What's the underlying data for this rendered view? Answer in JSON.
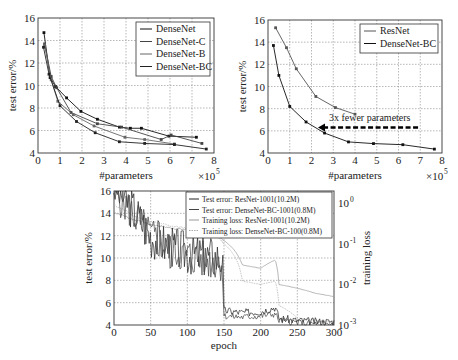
{
  "chart_data": [
    {
      "type": "line",
      "title": "",
      "xlabel": "#parameters",
      "x_multiplier": "×10^5",
      "ylabel": "test error/%",
      "xlim": [
        0,
        8
      ],
      "ylim": [
        4,
        16
      ],
      "xticks": [
        "0",
        "1",
        "2",
        "3",
        "4",
        "5",
        "6",
        "7",
        "8"
      ],
      "yticks": [
        "4",
        "6",
        "8",
        "10",
        "12",
        "14",
        "16"
      ],
      "grid": true,
      "legend_position": "upper right",
      "series": [
        {
          "name": "DenseNet",
          "x": [
            0.27,
            0.55,
            0.8,
            1.3,
            1.95,
            2.7,
            3.7,
            4.2,
            4.7,
            5.95,
            7.2
          ],
          "y": [
            14.7,
            10.7,
            9.9,
            8.9,
            7.7,
            7.0,
            6.3,
            6.2,
            6.2,
            5.5,
            5.4
          ]
        },
        {
          "name": "DenseNet-C",
          "x": [
            0.3,
            0.6,
            0.85,
            1.5,
            2.7,
            3.8,
            5.6,
            6.05,
            7.45
          ],
          "y": [
            13.7,
            10.8,
            9.8,
            7.6,
            6.6,
            6.3,
            5.2,
            5.6,
            4.85
          ]
        },
        {
          "name": "DenseNet-B",
          "x": [
            0.3,
            0.6,
            0.9,
            1.6,
            2.55,
            3.95,
            4.85,
            6.2
          ],
          "y": [
            13.6,
            10.5,
            8.6,
            7.4,
            6.4,
            5.4,
            5.2,
            4.8
          ]
        },
        {
          "name": "DenseNet-BC",
          "x": [
            0.25,
            0.5,
            1.0,
            1.75,
            2.6,
            3.7,
            4.85,
            6.2,
            7.65
          ],
          "y": [
            13.4,
            11.0,
            8.2,
            6.8,
            5.8,
            5.0,
            4.85,
            4.75,
            4.35
          ]
        }
      ]
    },
    {
      "type": "line",
      "title": "",
      "xlabel": "#parameters",
      "x_multiplier": "×10^5",
      "ylabel": "test error/%",
      "xlim": [
        0,
        8
      ],
      "ylim": [
        4,
        16
      ],
      "xticks": [
        "0",
        "1",
        "2",
        "3",
        "4",
        "5",
        "6",
        "7",
        "8"
      ],
      "yticks": [
        "4",
        "6",
        "8",
        "10",
        "12",
        "14",
        "16"
      ],
      "grid": true,
      "legend_position": "upper right",
      "annotations": [
        {
          "text": "3x fewer parameters",
          "arrow_from": [
            6.9,
            6.3
          ],
          "arrow_to": [
            2.3,
            6.3
          ]
        }
      ],
      "series": [
        {
          "name": "ResNet",
          "x": [
            0.35,
            0.85,
            1.3,
            2.2,
            3.1,
            4.0
          ],
          "y": [
            15.3,
            13.5,
            11.6,
            9.1,
            8.1,
            7.5
          ]
        },
        {
          "name": "DenseNet-BC",
          "x": [
            0.25,
            0.5,
            1.0,
            1.75,
            2.6,
            3.7,
            4.85,
            6.2,
            7.65
          ],
          "y": [
            13.7,
            11.0,
            8.2,
            6.8,
            5.8,
            5.0,
            4.85,
            4.75,
            4.35
          ]
        }
      ]
    },
    {
      "type": "line",
      "title": "",
      "xlabel": "epoch",
      "ylabel": "test error/%",
      "y2label": "training loss",
      "xlim": [
        0,
        300
      ],
      "ylim": [
        4,
        16
      ],
      "y2lim_log": [
        0.001,
        2
      ],
      "xticks": [
        "0",
        "50",
        "100",
        "150",
        "200",
        "250",
        "300"
      ],
      "yticks": [
        "4",
        "6",
        "8",
        "10",
        "12",
        "14",
        "16"
      ],
      "y2ticks": [
        "10^-3",
        "10^-2",
        "10^-1",
        "10^0"
      ],
      "grid": true,
      "legend_position": "upper right",
      "series": [
        {
          "name": "Test error: ResNet-1001(10.2M)",
          "axis": "left",
          "x": [
            0,
            25,
            50,
            75,
            100,
            125,
            148,
            150,
            175,
            200,
            220,
            225,
            250,
            275,
            300
          ],
          "y": [
            16.5,
            14.5,
            12.0,
            11.0,
            10.5,
            10.2,
            10.0,
            5.3,
            5.1,
            5.2,
            5.6,
            4.6,
            4.4,
            4.3,
            4.3
          ]
        },
        {
          "name": "Test error: DenseNet-BC-1001(0.8M)",
          "axis": "left",
          "x": [
            0,
            25,
            50,
            75,
            100,
            125,
            148,
            150,
            175,
            200,
            220,
            225,
            250,
            275,
            300
          ],
          "y": [
            16.0,
            14.0,
            12.0,
            10.8,
            10.2,
            9.8,
            9.6,
            4.8,
            4.7,
            4.8,
            5.0,
            4.4,
            4.2,
            4.1,
            4.1
          ]
        },
        {
          "name": "Training loss: ResNet-1001(10.2M)",
          "axis": "right",
          "x": [
            0,
            25,
            50,
            75,
            100,
            125,
            150,
            175,
            200,
            220,
            225,
            250,
            275,
            300
          ],
          "y": [
            0.6,
            0.4,
            0.3,
            0.25,
            0.22,
            0.2,
            0.12,
            0.03,
            0.025,
            0.04,
            0.01,
            0.008,
            0.006,
            0.005
          ]
        },
        {
          "name": "Training loss: DenseNet-BC-100(0.8M)",
          "axis": "right",
          "x": [
            0,
            25,
            50,
            75,
            100,
            125,
            150,
            175,
            200,
            220,
            225,
            250,
            275,
            300
          ],
          "y": [
            0.9,
            0.5,
            0.35,
            0.28,
            0.24,
            0.22,
            0.1,
            0.012,
            0.01,
            0.012,
            0.003,
            0.0015,
            0.0013,
            0.0012
          ]
        }
      ]
    }
  ],
  "charts": {
    "top_left": {
      "ylabel": "test error/%",
      "xlabel": "#parameters",
      "multiplier": "×10",
      "multiplier_exp": "5",
      "legend": [
        "DenseNet",
        "DenseNet-C",
        "DenseNet-B",
        "DenseNet-BC"
      ]
    },
    "top_right": {
      "ylabel": "test error/%",
      "xlabel": "#parameters",
      "multiplier": "×10",
      "multiplier_exp": "5",
      "legend": [
        "ResNet",
        "DenseNet-BC"
      ],
      "annotation": "3x fewer parameters"
    },
    "bottom": {
      "ylabel": "test error/%",
      "xlabel": "epoch",
      "y2label": "training loss",
      "legend": [
        "Test error: ResNet-1001(10.2M)",
        "Test error: DenseNet-BC-1001(0.8M)",
        "Training loss: ResNet-1001(10.2M)",
        "Training loss: DenseNet-BC-100(0.8M)"
      ]
    }
  }
}
